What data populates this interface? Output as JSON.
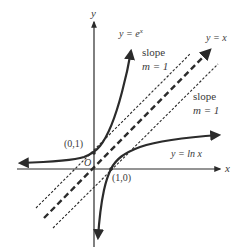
{
  "diagram": {
    "axes": {
      "x_label": "x",
      "y_label": "y",
      "origin_label": "O"
    },
    "curves": [
      {
        "name": "exp",
        "label_prefix": "y = e",
        "label_sup": "x",
        "style": "solid-thick",
        "arrow": "both"
      },
      {
        "name": "ln",
        "label": "y = ln x",
        "style": "solid-thick",
        "arrow": "both"
      },
      {
        "name": "identity",
        "label": "y = x",
        "style": "dashed-thick",
        "arrow": "end"
      }
    ],
    "tangent_lines": [
      {
        "name": "tangent-exp",
        "style": "dashed-thin",
        "label_line1": "slope",
        "label_line2": "m = 1"
      },
      {
        "name": "tangent-ln",
        "style": "dashed-thin",
        "label_line1": "slope",
        "label_line2": "m = 1"
      }
    ],
    "points": [
      {
        "name": "point-0-1",
        "label": "(0,1)"
      },
      {
        "name": "point-1-0",
        "label": "(1,0)"
      }
    ],
    "colors": {
      "ink": "#2b2b2b",
      "text": "#3a3a3a",
      "background": "#ffffff"
    }
  }
}
